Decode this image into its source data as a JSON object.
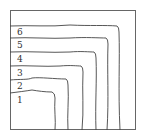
{
  "diagram": {
    "type": "nested-contour-lines",
    "levels": [
      {
        "label": "6",
        "y": 26,
        "x_end": 118
      },
      {
        "label": "5",
        "y": 38,
        "x_end": 107
      },
      {
        "label": "4",
        "y": 52,
        "x_end": 95
      },
      {
        "label": "3",
        "y": 66,
        "x_end": 82
      },
      {
        "label": "2",
        "y": 79,
        "x_end": 68
      },
      {
        "label": "1",
        "y": 92,
        "x_end": 55
      }
    ],
    "line_color": "#444444",
    "frame_color": "#555555"
  }
}
